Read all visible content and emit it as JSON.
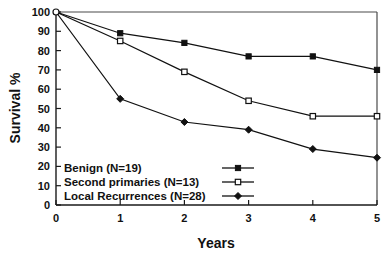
{
  "chart_data": {
    "type": "line",
    "title": "",
    "subtitle": "",
    "xlabel": "Years",
    "ylabel": "Survival %",
    "x": [
      0,
      1,
      2,
      3,
      4,
      5
    ],
    "xlim": [
      0,
      5
    ],
    "ylim": [
      0,
      100
    ],
    "xticks": [
      "0",
      "1",
      "2",
      "3",
      "4",
      "5"
    ],
    "yticks": [
      "0",
      "10",
      "20",
      "30",
      "40",
      "50",
      "60",
      "70",
      "80",
      "90",
      "100"
    ],
    "grid": false,
    "legend_position": "inside-bottom-left",
    "series": [
      {
        "name": "Benign (N=19)",
        "group": "Benign",
        "n": 19,
        "marker": "filled-square",
        "values": [
          100,
          89,
          84,
          77,
          77,
          70
        ]
      },
      {
        "name": "Second primaries (N=13)",
        "group": "Second primaries",
        "n": 13,
        "marker": "open-square",
        "values": [
          100,
          85,
          69,
          54,
          46,
          46
        ]
      },
      {
        "name": "Local Recurrences (N=28)",
        "group": "Local Recurrences",
        "n": 28,
        "marker": "filled-diamond",
        "values": [
          100,
          55,
          43,
          39,
          29,
          24.5
        ]
      }
    ],
    "colors": {
      "line": "#111111",
      "axis": "#1a1a1a",
      "frame": "#4a4a4a",
      "background": "#ffffff"
    }
  },
  "axes": {
    "y_title": "Survival %",
    "x_title": "Years"
  },
  "legend": {
    "items": [
      {
        "label": "Benign (N=19)",
        "marker": "filled-square"
      },
      {
        "label": "Second primaries (N=13)",
        "marker": "open-square"
      },
      {
        "label": "Local Recurrences (N=28)",
        "marker": "filled-diamond"
      }
    ]
  },
  "yticks": {
    "t0": "0",
    "t1": "10",
    "t2": "20",
    "t3": "30",
    "t4": "40",
    "t5": "50",
    "t6": "60",
    "t7": "70",
    "t8": "80",
    "t9": "90",
    "t10": "100"
  },
  "xticks": {
    "t0": "0",
    "t1": "1",
    "t2": "2",
    "t3": "3",
    "t4": "4",
    "t5": "5"
  }
}
